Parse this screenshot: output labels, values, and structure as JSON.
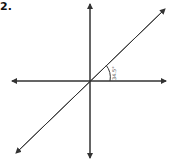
{
  "figure": {
    "label": "2.",
    "angle_label": "34.5°"
  }
}
